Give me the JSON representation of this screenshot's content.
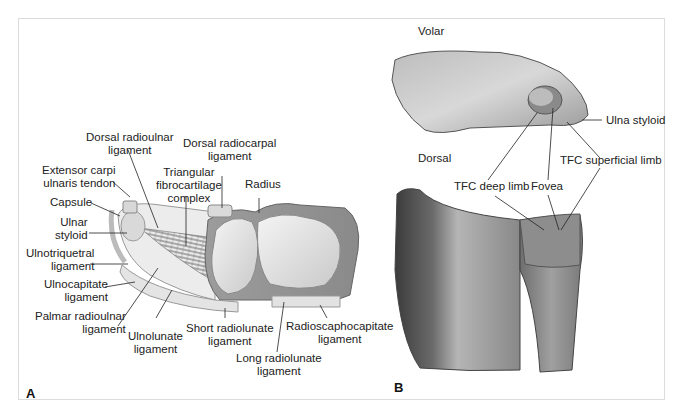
{
  "figure": {
    "panels": [
      {
        "id": "A",
        "letter": "A",
        "labels": {
          "dorsal_radioulnar": [
            "Dorsal radioulnar",
            "ligament"
          ],
          "dorsal_radiocarpal": [
            "Dorsal radiocarpal",
            "ligament"
          ],
          "ecu_tendon": [
            "Extensor carpi",
            "ulnaris tendon"
          ],
          "tfcc": [
            "Triangular",
            "fibrocartilage",
            "complex"
          ],
          "radius": "Radius",
          "capsule": "Capsule",
          "ulnar_styloid": [
            "Ulnar",
            "styloid"
          ],
          "ulnotriquetral": [
            "Ulnotriquetral",
            "ligament"
          ],
          "ulnocapitate": [
            "Ulnocapitate",
            "ligament"
          ],
          "palmar_radioulnar": [
            "Palmar radioulnar",
            "ligament"
          ],
          "ulnolunate": [
            "Ulnolunate",
            "ligament"
          ],
          "short_radiolunate": [
            "Short radiolunate",
            "ligament"
          ],
          "long_radiolunate": [
            "Long radiolunate",
            "ligament"
          ],
          "radioscaphocapitate": [
            "Radioscaphocapitate",
            "ligament"
          ]
        }
      },
      {
        "id": "B",
        "letter": "B",
        "labels": {
          "volar": "Volar",
          "dorsal": "Dorsal",
          "ulna_styloid": "Ulna styloid",
          "tfc_superficial": "TFC superficial limb",
          "tfc_deep": "TFC deep limb",
          "fovea": "Fovea"
        }
      }
    ]
  }
}
